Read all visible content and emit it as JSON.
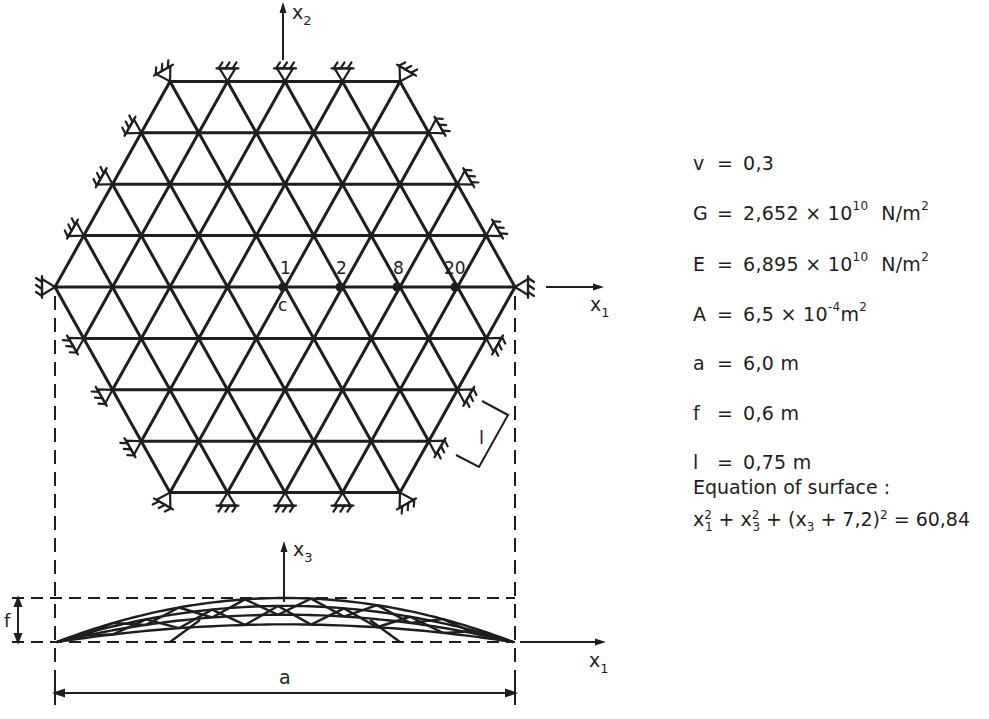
{
  "figure": {
    "type": "single-layer lattice dome, plan view and elevation",
    "plan_view": {
      "axis_x1_label": "x",
      "axis_x1_sub": "1",
      "axis_x2_label": "x",
      "axis_x2_sub": "2",
      "node_labels": [
        "1",
        "2",
        "8",
        "20"
      ],
      "center_label": "c",
      "member_length_label": "l",
      "grid_rows": 9,
      "nodes_per_row": [
        5,
        6,
        7,
        8,
        9,
        8,
        7,
        6,
        5
      ]
    },
    "elevation_view": {
      "axis_x1_label": "x",
      "axis_x1_sub": "1",
      "axis_x3_label": "x",
      "axis_x3_sub": "3",
      "rise_label": "f",
      "span_label": "a"
    }
  },
  "parameters": [
    {
      "symbol": "v",
      "value": "0,3",
      "unit": ""
    },
    {
      "symbol": "G",
      "value": "2,652 × 10",
      "exponent": "10",
      "unit": "N/m",
      "unit_exp": "2"
    },
    {
      "symbol": "E",
      "value": "6,895 × 10",
      "exponent": "10",
      "unit": "N/m",
      "unit_exp": "2"
    },
    {
      "symbol": "A",
      "value": "6,5 × 10",
      "exponent": "-4",
      "unit": "m",
      "unit_exp": "2"
    },
    {
      "symbol": "a",
      "value": "6,0 m",
      "unit": ""
    },
    {
      "symbol": "f",
      "value": "0,6 m",
      "unit": ""
    },
    {
      "symbol": "l",
      "value": "0,75 m",
      "unit": ""
    }
  ],
  "equation": {
    "title": "Equation of surface :",
    "text": "x1² + x3² + (x3 + 7,2)² = 60,84",
    "parts": {
      "t1": "x",
      "t1_sup": "2",
      "t1_sub": "1",
      "plus1": " + ",
      "t2": "x",
      "t2_sup": "2",
      "t2_sub": "3",
      "plus2": " + (x",
      "t3_sub": "3",
      "t3_rest": " + 7,2)",
      "t3_sup": "2",
      "rhs": " = 60,84"
    }
  }
}
